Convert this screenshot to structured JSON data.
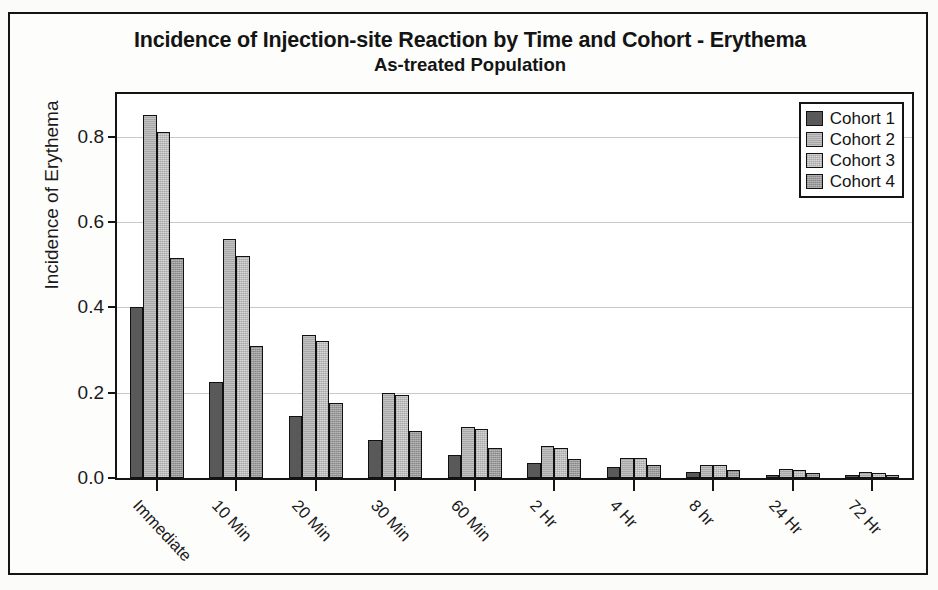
{
  "figure": {
    "title": "Incidence of Injection-site Reaction by Time and Cohort - Erythema",
    "subtitle": "As-treated Population"
  },
  "legend": {
    "position": "top-right",
    "entries": [
      {
        "label": "Cohort 1",
        "color": "#595959"
      },
      {
        "label": "Cohort 2",
        "color": "#a8a8a8"
      },
      {
        "label": "Cohort 3",
        "color": "#bdbdbd"
      },
      {
        "label": "Cohort 4",
        "color": "#9a9a9a"
      }
    ]
  },
  "chart_data": {
    "type": "bar",
    "title": "Incidence of Injection-site Reaction by Time and Cohort - Erythema",
    "subtitle": "As-treated Population",
    "xlabel": "",
    "ylabel": "Incidence of Erythema",
    "ylim": [
      0.0,
      0.9
    ],
    "yticks": [
      0.0,
      0.2,
      0.4,
      0.6,
      0.8
    ],
    "ytick_labels": [
      "0.0",
      "0.2",
      "0.4",
      "0.6",
      "0.8"
    ],
    "grid": true,
    "grouping": "grouped",
    "categories": [
      "Immediate",
      "10 Min",
      "20 Min",
      "30 Min",
      "60 Min",
      "2 Hr",
      "4 Hr",
      "8 hr",
      "24 Hr",
      "72 Hr"
    ],
    "series": [
      {
        "name": "Cohort 1",
        "color": "#595959",
        "values": [
          0.4,
          0.225,
          0.145,
          0.09,
          0.055,
          0.035,
          0.025,
          0.015,
          0.008,
          0.005
        ]
      },
      {
        "name": "Cohort 2",
        "color": "#a8a8a8",
        "values": [
          0.85,
          0.56,
          0.335,
          0.2,
          0.12,
          0.075,
          0.047,
          0.031,
          0.021,
          0.013
        ]
      },
      {
        "name": "Cohort 3",
        "color": "#bdbdbd",
        "values": [
          0.81,
          0.52,
          0.32,
          0.195,
          0.115,
          0.07,
          0.046,
          0.03,
          0.019,
          0.012
        ]
      },
      {
        "name": "Cohort 4",
        "color": "#9a9a9a",
        "values": [
          0.515,
          0.31,
          0.175,
          0.11,
          0.07,
          0.045,
          0.03,
          0.018,
          0.012,
          0.008
        ]
      }
    ]
  }
}
